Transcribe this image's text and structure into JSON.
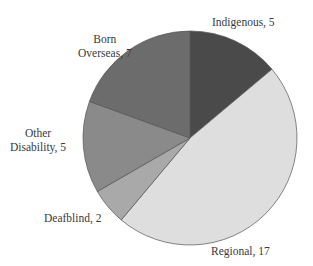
{
  "chart_data": {
    "type": "pie",
    "title": "",
    "start_angle_deg": 0,
    "direction": "clockwise",
    "slices": [
      {
        "label": "Indigenous",
        "value": 5,
        "color": "#4a4a4a"
      },
      {
        "label": "Regional",
        "value": 17,
        "color": "#dedede"
      },
      {
        "label": "Deafblind",
        "value": 2,
        "color": "#a9a9a9"
      },
      {
        "label": "Other Disability",
        "value": 5,
        "color": "#8a8a8a"
      },
      {
        "label": "Born Overseas",
        "value": 7,
        "color": "#6c6c6c"
      }
    ],
    "total": 36
  },
  "labels": {
    "indigenous": "Indigenous, 5",
    "regional": "Regional, 17",
    "deafblind": "Deafblind, 2",
    "other_line1": "Other",
    "other_line2": "Disability, 5",
    "born_line1": "Born",
    "born_line2": "Overseas, 7"
  }
}
